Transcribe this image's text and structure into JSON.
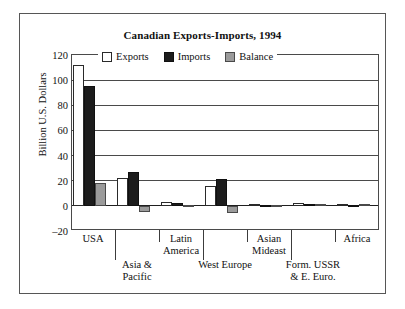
{
  "figure": {
    "title": "Canadian Exports-Imports, 1994"
  },
  "chart_data": {
    "type": "bar",
    "title": "Canadian Exports-Imports, 1994",
    "xlabel": "",
    "ylabel": "Billion U.S. Dollars",
    "ylim": [
      -20,
      120
    ],
    "yticks": [
      120,
      100,
      80,
      60,
      40,
      20,
      0,
      -20
    ],
    "grid": true,
    "legend_position": "inside-top-center",
    "categories": [
      "USA",
      "Asia &\nPacific",
      "Latin\nAmerica",
      "West Europe",
      "Asian\nMideast",
      "Form. USSR\n& E. Euro.",
      "Africa"
    ],
    "series": [
      {
        "name": "Exports",
        "color": "#ffffff",
        "values": [
          112,
          22.5,
          3,
          16,
          1.5,
          2,
          1.5
        ]
      },
      {
        "name": "Imports",
        "color": "#1c1c1c",
        "values": [
          95,
          27,
          2,
          21,
          1,
          1.5,
          1
        ]
      },
      {
        "name": "Balance",
        "color": "#9b9b9b",
        "values": [
          18,
          -5,
          1,
          -6,
          0.5,
          1.5,
          1.5
        ]
      }
    ]
  },
  "legend": {
    "items": [
      {
        "label": "Exports",
        "swatch": "exports"
      },
      {
        "label": "Imports",
        "swatch": "imports"
      },
      {
        "label": "Balance",
        "swatch": "balance"
      }
    ]
  },
  "axis": {
    "y_title": "Billion U.S. Dollars",
    "y_tick_labels": [
      "120",
      "100",
      "80",
      "60",
      "40",
      "20",
      "0",
      "–20"
    ]
  },
  "category_labels": [
    {
      "text": "USA",
      "row": 0
    },
    {
      "text": "Asia &\nPacific",
      "row": 2
    },
    {
      "text": "Latin\nAmerica",
      "row": 0
    },
    {
      "text": "West Europe",
      "row": 2
    },
    {
      "text": "Asian\nMideast",
      "row": 0
    },
    {
      "text": "Form. USSR\n& E. Euro.",
      "row": 2
    },
    {
      "text": "Africa",
      "row": 0
    }
  ]
}
